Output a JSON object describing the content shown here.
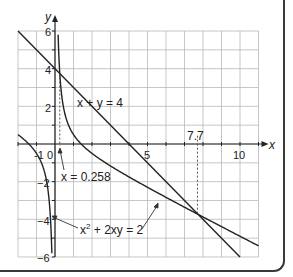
{
  "chart_data": {
    "type": "line",
    "title": "",
    "xlabel": "x",
    "ylabel": "y",
    "xlim": [
      -2,
      11
    ],
    "ylim": [
      -6,
      6
    ],
    "grid": true,
    "x_ticks": [
      {
        "value": -1,
        "label": "-1"
      },
      {
        "value": 0,
        "label": "0"
      },
      {
        "value": 5,
        "label": "5"
      },
      {
        "value": 10,
        "label": "10"
      }
    ],
    "y_ticks": [
      {
        "value": 6,
        "label": "6"
      },
      {
        "value": 4,
        "label": "4"
      },
      {
        "value": 2,
        "label": "2"
      },
      {
        "value": -2,
        "label": "-2"
      },
      {
        "value": -4,
        "label": "-4"
      },
      {
        "value": -6,
        "label": "-6"
      }
    ],
    "series": [
      {
        "name": "x + y = 4",
        "kind": "line",
        "equation": "y = 4 - x",
        "x_range": [
          -2,
          10
        ]
      },
      {
        "name": "x² + 2xy = 2",
        "kind": "curve",
        "equation": "y = (2 - x²) / (2x)",
        "branches": [
          [
            -2,
            -0.17
          ],
          [
            0.17,
            11
          ]
        ]
      }
    ],
    "intersections": [
      {
        "x": 0.258,
        "y": 3.742
      },
      {
        "x": 7.7,
        "y": -3.7
      }
    ],
    "annotations": [
      {
        "text": "x + y = 4",
        "x": 1.2,
        "y": 3.2
      },
      {
        "text": "x = 0.258",
        "x": 0.3,
        "y": -1.5
      },
      {
        "text": "7.7",
        "x": 7.7,
        "y": 0.4
      },
      {
        "text": "x² + 2xy = 2",
        "x": 1.3,
        "y": -4.6
      }
    ]
  },
  "labels": {
    "x_axis": "x",
    "y_axis": "y",
    "line_eq": "x + y = 4",
    "curve_eq_x": "x",
    "curve_eq_sup": "2",
    "curve_eq_rest": " + 2xy = 2",
    "vline_left": "x = 0.258",
    "vline_right": "7.7",
    "ticks": {
      "xm1": "-1",
      "x0": "0",
      "x5": "5",
      "x10": "10",
      "y6": "6",
      "y4": "4",
      "y2": "2",
      "ym2": "−2",
      "ym4": "−4",
      "ym6": "−6"
    }
  }
}
